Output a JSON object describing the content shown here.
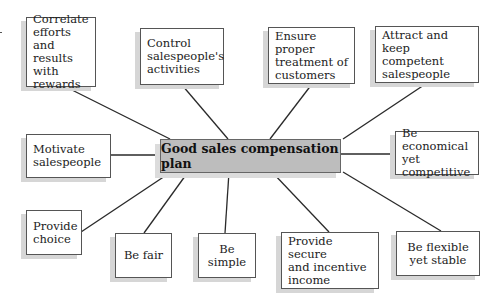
{
  "diagram": {
    "center": {
      "label": "Good sales compensation plan",
      "fill": "#bdbdbd"
    },
    "nodes": [
      {
        "id": "correlate",
        "label": "Correlate\nefforts and\nresults with\nrewards"
      },
      {
        "id": "control",
        "label": "Control\nsalespeople's\nactivities"
      },
      {
        "id": "ensure",
        "label": "Ensure proper\ntreatment of\ncustomers"
      },
      {
        "id": "attract",
        "label": "Attract and keep\ncompetent\nsalespeople"
      },
      {
        "id": "motivate",
        "label": "Motivate\nsalespeople"
      },
      {
        "id": "economical",
        "label": "Be economical\nyet competitive"
      },
      {
        "id": "choice",
        "label": "Provide\nchoice"
      },
      {
        "id": "fair",
        "label": "Be fair"
      },
      {
        "id": "simple",
        "label": "Be simple"
      },
      {
        "id": "secure",
        "label": "Provide secure\nand incentive\nincome"
      },
      {
        "id": "flexible",
        "label": "Be flexible\nyet stable"
      }
    ]
  }
}
